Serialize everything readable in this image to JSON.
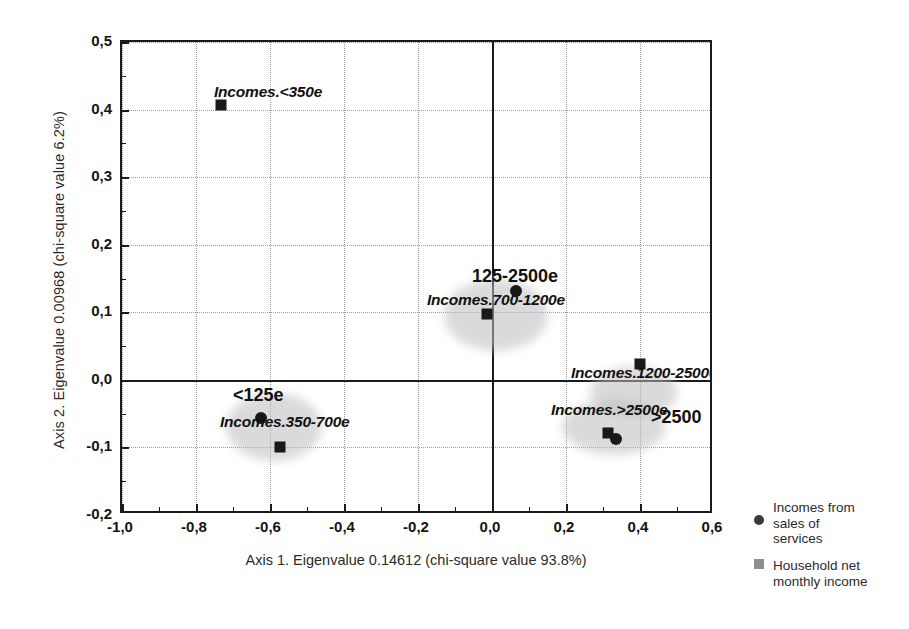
{
  "chart_data": {
    "type": "scatter",
    "title": "",
    "xlabel": "Axis 1. Eigenvalue 0.14612 (chi-square value 93.8%)",
    "ylabel": "Axis 2. Eigenvalue 0.00968 (chi-square value 6.2%)",
    "xlim": [
      -1.0,
      0.6
    ],
    "ylim": [
      -0.2,
      0.5
    ],
    "xticks": [
      "-1,0",
      "-0,8",
      "-0,6",
      "-0,4",
      "-0,2",
      "0,0",
      "0,2",
      "0,4",
      "0,6"
    ],
    "xtick_values": [
      -1.0,
      -0.8,
      -0.6,
      -0.4,
      -0.2,
      0.0,
      0.2,
      0.4,
      0.6
    ],
    "yticks": [
      "0,5",
      "0,4",
      "0,3",
      "0,2",
      "0,1",
      "0,0",
      "-0,1",
      "-0,2"
    ],
    "ytick_values": [
      0.5,
      0.4,
      0.3,
      0.2,
      0.1,
      0.0,
      -0.1,
      -0.2
    ],
    "grid": true,
    "legend_position": "right",
    "series": [
      {
        "name": "Incomes from sales of services",
        "marker": "circle",
        "points": [
          {
            "label": "125-2500e",
            "x": 0.065,
            "y": 0.132
          },
          {
            "label": "<125e",
            "x": -0.625,
            "y": -0.056
          },
          {
            "label": ">2500",
            "x": 0.335,
            "y": -0.088
          }
        ]
      },
      {
        "name": "Household net monthly income",
        "marker": "square",
        "points": [
          {
            "label": "Incomes.<350e",
            "x": -0.733,
            "y": 0.407
          },
          {
            "label": "Incomes.700-1200e",
            "x": -0.013,
            "y": 0.098
          },
          {
            "label": "Incomes.350-700e",
            "x": -0.572,
            "y": -0.1
          },
          {
            "label": "Incomes.1200-2500e",
            "x": 0.4,
            "y": 0.024
          },
          {
            "label": "Incomes.>2500e",
            "x": 0.313,
            "y": -0.078
          }
        ]
      }
    ],
    "point_labels": [
      {
        "text": "Incomes.<350e",
        "style": "italic",
        "x": 212,
        "y": 82
      },
      {
        "text": "125-2500e",
        "style": "plain",
        "x": 470,
        "y": 265
      },
      {
        "text": "Incomes.700-1200e",
        "style": "italic",
        "x": 425,
        "y": 290
      },
      {
        "text": "<125e",
        "style": "plain",
        "x": 231,
        "y": 384
      },
      {
        "text": "Incomes.350-700e",
        "style": "italic",
        "x": 218,
        "y": 412
      },
      {
        "text": "Incomes.1200-2500e",
        "style": "italic",
        "x": 569,
        "y": 363
      },
      {
        "text": "Incomes.>2500e",
        "style": "italic",
        "x": 549,
        "y": 400
      },
      {
        "text": ">2500",
        "style": "plain",
        "x": 649,
        "y": 406
      }
    ],
    "halos": [
      {
        "cx": 494,
        "cy": 313,
        "rx": 52,
        "ry": 36
      },
      {
        "cx": 272,
        "cy": 425,
        "rx": 48,
        "ry": 34
      },
      {
        "cx": 632,
        "cy": 390,
        "rx": 44,
        "ry": 25
      },
      {
        "cx": 612,
        "cy": 425,
        "rx": 52,
        "ry": 28
      }
    ]
  },
  "legend": {
    "entries": [
      {
        "symbol": "circle-marker",
        "line1": "Incomes from",
        "line2": "sales of",
        "line3": "services"
      },
      {
        "symbol": "square-marker",
        "line1": "Household net",
        "line2": "monthly income",
        "line3": ""
      }
    ]
  }
}
